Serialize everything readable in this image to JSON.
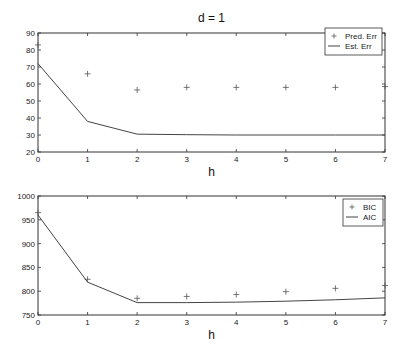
{
  "chart_data": [
    {
      "type": "line",
      "title": "d = 1",
      "xlabel": "h",
      "ylabel": "",
      "x": [
        0,
        1,
        2,
        3,
        4,
        5,
        6,
        7
      ],
      "xlim": [
        0,
        7
      ],
      "ylim": [
        20,
        90
      ],
      "xticks": [
        0,
        1,
        2,
        3,
        4,
        5,
        6,
        7
      ],
      "yticks": [
        20,
        30,
        40,
        50,
        60,
        70,
        80,
        90
      ],
      "grid": false,
      "legend_position": "upper right",
      "series": [
        {
          "name": "Pred. Err",
          "style": "marker-plus",
          "values": [
            83,
            66,
            56.5,
            58,
            58,
            58,
            58,
            58.5
          ]
        },
        {
          "name": "Est. Err",
          "style": "line",
          "values": [
            72,
            38,
            30.5,
            30.2,
            30,
            30,
            30,
            30
          ]
        }
      ]
    },
    {
      "type": "line",
      "title": "",
      "xlabel": "h",
      "ylabel": "",
      "x": [
        0,
        1,
        2,
        3,
        4,
        5,
        6,
        7
      ],
      "xlim": [
        0,
        7
      ],
      "ylim": [
        750,
        1000
      ],
      "xticks": [
        0,
        1,
        2,
        3,
        4,
        5,
        6,
        7
      ],
      "yticks": [
        750,
        800,
        850,
        900,
        950,
        1000
      ],
      "grid": false,
      "legend_position": "upper right",
      "series": [
        {
          "name": "BIC",
          "style": "marker-plus",
          "values": [
            965,
            825,
            785,
            789,
            793,
            799,
            806,
            812
          ]
        },
        {
          "name": "AIC",
          "style": "line",
          "values": [
            960,
            819,
            776,
            776,
            777,
            779,
            782,
            786
          ]
        }
      ]
    }
  ],
  "colors": {
    "axis": "#333333",
    "line": "#444444",
    "marker": "#555555",
    "background": "#ffffff"
  }
}
